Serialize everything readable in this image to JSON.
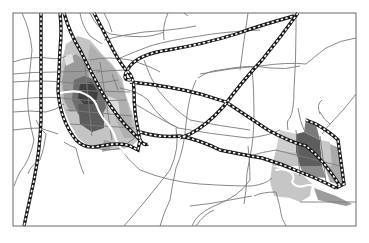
{
  "map": {
    "width": 369,
    "height": 243,
    "frame": {
      "x": 13,
      "y": 13,
      "w": 343,
      "h": 213,
      "stroke": "#6a6a6a"
    },
    "colors": {
      "background": "#ffffff",
      "road": "#7a7a7a",
      "rail_outer": "#1a1a1a",
      "rail_inner": "#ffffff",
      "river": "#ffffff",
      "zone_light": "#c9c9c9",
      "zone_mid": "#a8a8a8",
      "zone_dark": "#7c7c7c",
      "zone_darker": "#5a5a5a",
      "zone_darkest": "#3c3c3c"
    },
    "layers": [
      "districts",
      "roads",
      "river",
      "railways",
      "frame"
    ],
    "districts": {
      "west_city": "Main urban core (west)",
      "east_city": "Secondary urban area (east)"
    },
    "legend": []
  }
}
